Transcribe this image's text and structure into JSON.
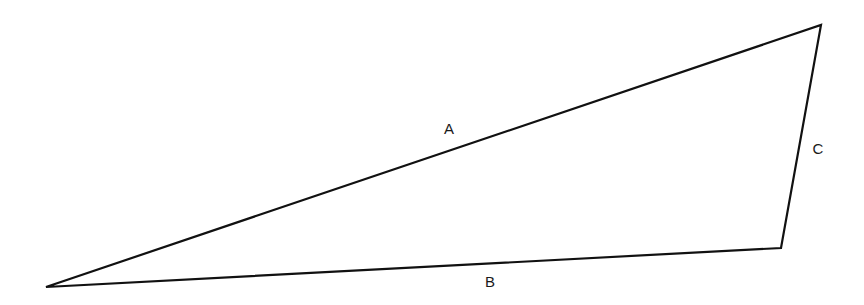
{
  "diagram": {
    "type": "triangle",
    "stroke_color": "#111111",
    "vertices": [
      {
        "x": 46,
        "y": 287
      },
      {
        "x": 821,
        "y": 25
      },
      {
        "x": 781,
        "y": 248
      }
    ],
    "sides": [
      {
        "label": "A",
        "from": 0,
        "to": 1,
        "label_pos": {
          "x": 449,
          "y": 128
        }
      },
      {
        "label": "C",
        "from": 1,
        "to": 2,
        "label_pos": {
          "x": 818,
          "y": 148
        }
      },
      {
        "label": "B",
        "from": 2,
        "to": 0,
        "label_pos": {
          "x": 490,
          "y": 281
        }
      }
    ]
  }
}
